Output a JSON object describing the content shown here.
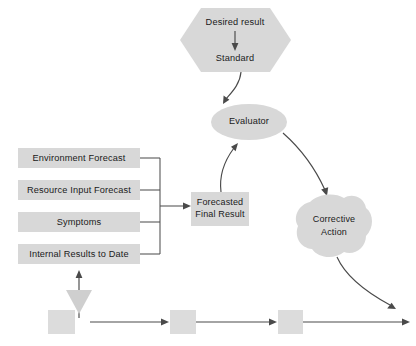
{
  "diagram": {
    "colors": {
      "shape_fill": "#d8d8d8",
      "connector": "#4a4a4a",
      "text": "#1a1a1a",
      "background": "#ffffff",
      "triangle_marker": "#cfcfcf"
    },
    "nodes": {
      "standard_hexagon": {
        "shape": "hexagon",
        "line1": "Desired result",
        "line2": "Standard"
      },
      "evaluator": {
        "shape": "ellipse",
        "label": "Evaluator"
      },
      "forecasted_final_result": {
        "shape": "rectangle",
        "line1": "Forecasted",
        "line2": "Final Result"
      },
      "corrective_action": {
        "shape": "blob",
        "line1": "Corrective",
        "line2": "Action"
      }
    },
    "inputs": [
      {
        "label": "Environment Forecast"
      },
      {
        "label": "Resource Input Forecast"
      },
      {
        "label": "Symptoms"
      },
      {
        "label": "Internal Results to Date"
      }
    ],
    "process_steps": [
      {
        "label": ""
      },
      {
        "label": ""
      },
      {
        "label": ""
      }
    ],
    "connectors": [
      {
        "from": "Desired result",
        "to": "Standard",
        "style": "straight-arrow-down"
      },
      {
        "from": "Standard",
        "to": "Evaluator",
        "style": "curved-arrow-down"
      },
      {
        "from": "Forecasted Final Result",
        "to": "Evaluator",
        "style": "curved-arrow-up"
      },
      {
        "from": "Evaluator",
        "to": "Corrective Action",
        "style": "curved-arrow-down"
      },
      {
        "from": "Inputs bracket",
        "to": "Forecasted Final Result",
        "style": "straight-arrow-right"
      },
      {
        "from": "Process line",
        "to": "Internal Results to Date",
        "style": "straight-arrow-up"
      },
      {
        "from": "Corrective Action",
        "to": "Process line",
        "style": "curved-arrow-down"
      }
    ]
  }
}
